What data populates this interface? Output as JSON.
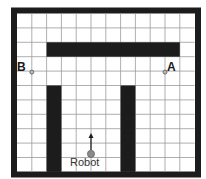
{
  "grid": {
    "columns": 12,
    "rows": 11,
    "origin_x": 17,
    "origin_y": 13.5,
    "cell_w": 14.8,
    "cell_h": 14.4,
    "line_color": "#9a9a9a",
    "wall_color": "#1c1c1c",
    "border_width": 6
  },
  "obstacles": [
    {
      "name": "top-bar",
      "col": 2,
      "row": 2,
      "cols": 9,
      "rows": 1
    },
    {
      "name": "left-pillar",
      "col": 2,
      "row": 5,
      "cols": 1,
      "rows": 6
    },
    {
      "name": "right-pillar",
      "col": 7,
      "row": 5,
      "cols": 1,
      "rows": 6
    }
  ],
  "points": [
    {
      "name": "point-b",
      "label": "B",
      "gx": 1,
      "gy": 4
    },
    {
      "name": "point-a",
      "label": "A",
      "gx": 10,
      "gy": 4
    }
  ],
  "robot": {
    "label": "Robot",
    "gx": 5,
    "gy": 9.75,
    "heading": "up",
    "color": "#8a8a8a"
  },
  "labels": {
    "a": "A",
    "b": "B",
    "robot": "Robot"
  }
}
